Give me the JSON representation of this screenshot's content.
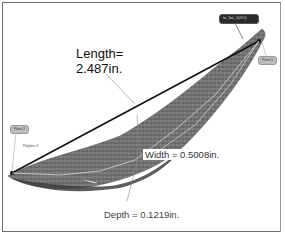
{
  "figure": {
    "measurements": {
      "length_label": "Length=",
      "length_value": "2.487in.",
      "width_text": "Width = 0.5008in.",
      "depth_text": "Depth = 0.1219in."
    },
    "annotations": {
      "top_tag": "lw_3wt_1(09.0)",
      "point_left": "Point 2",
      "point_right": "Point 5",
      "polyline": "Polyline 2"
    },
    "colors": {
      "scan_fill": "#6b6b6b",
      "scan_dark": "#3d3d3d",
      "length_line": "#111111",
      "leader_line": "#8a8a8a",
      "frame": "#6e6e6e"
    }
  }
}
